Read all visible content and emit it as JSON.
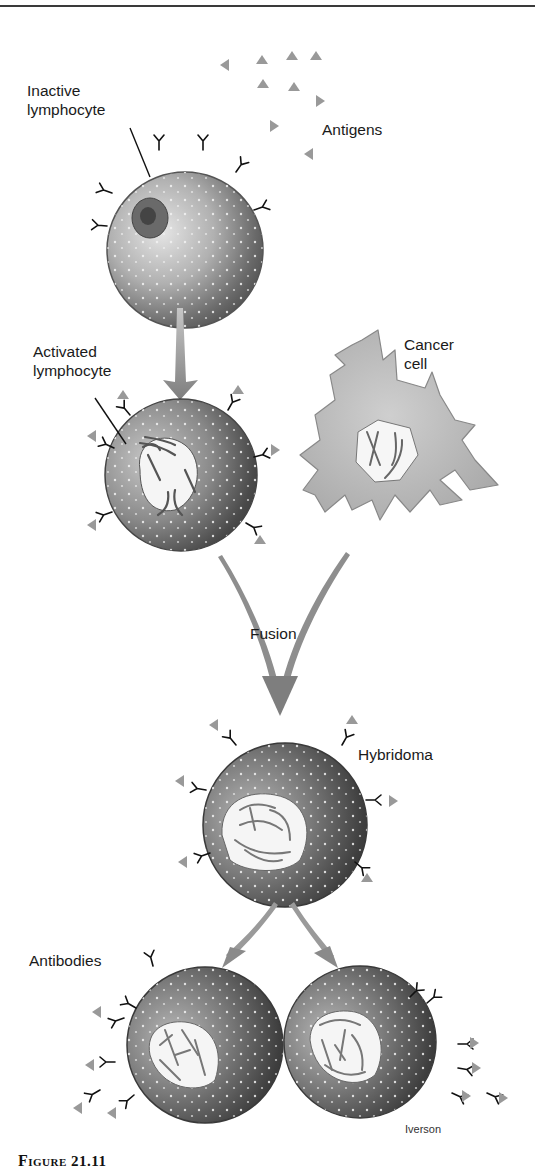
{
  "figure": {
    "caption": {
      "prefix": "Figure",
      "number": "21.11"
    },
    "credit": "Iverson"
  },
  "labels": {
    "inactive_lymphocyte": "Inactive\nlymphocyte",
    "antigens": "Antigens",
    "activated_lymphocyte": "Activated\nlymphocyte",
    "cancer_cell": "Cancer\ncell",
    "fusion": "Fusion",
    "hybridoma": "Hybridoma",
    "antibodies": "Antibodies"
  },
  "colors": {
    "background": "#ffffff",
    "text": "#1a1a1a",
    "cell_dark": "#3c3c3c",
    "cell_mid": "#7a7a7a",
    "cell_light": "#d8d8d8",
    "cancer_cell": "#b4b4b4",
    "arrow": "#8a8a8a",
    "antigen": "#9a9a9a",
    "antibody": "#111111"
  }
}
